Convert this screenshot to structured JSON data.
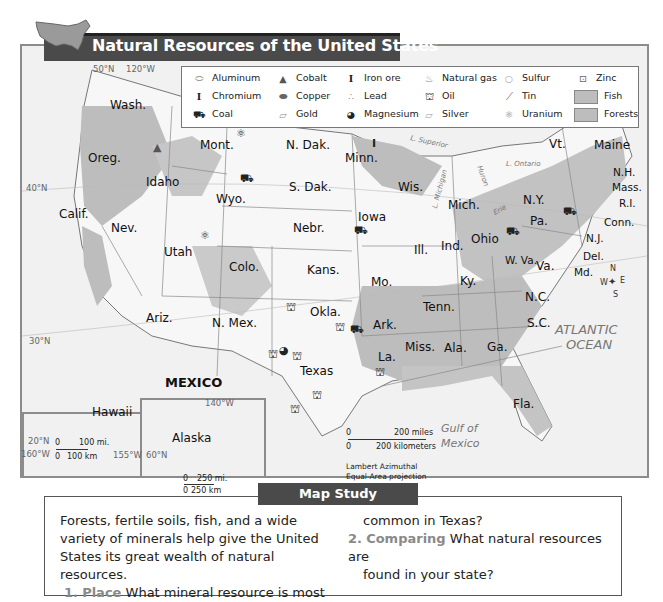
{
  "header": {
    "title": "Natural Resources of the United States"
  },
  "legend": {
    "items": [
      {
        "label": "Aluminum",
        "icon": "cylinder-icon",
        "glyph": "⬭"
      },
      {
        "label": "Chromium",
        "icon": "i-beam-icon",
        "glyph": "I"
      },
      {
        "label": "Coal",
        "icon": "coal-cart-icon",
        "glyph": "⛟"
      },
      {
        "label": "Cobalt",
        "icon": "triangle-icon",
        "glyph": "▲"
      },
      {
        "label": "Copper",
        "icon": "dark-cylinder-icon",
        "glyph": "⬬"
      },
      {
        "label": "Gold",
        "icon": "gold-bar-icon",
        "glyph": "▱"
      },
      {
        "label": "Iron ore",
        "icon": "i-beam-icon",
        "glyph": "I"
      },
      {
        "label": "Lead",
        "icon": "lead-balls-icon",
        "glyph": "∴"
      },
      {
        "label": "Magnesium",
        "icon": "quartered-circle-icon",
        "glyph": "◕"
      },
      {
        "label": "Natural gas",
        "icon": "flame-icon",
        "glyph": "♨"
      },
      {
        "label": "Oil",
        "icon": "oil-derrick-icon",
        "glyph": "⛫"
      },
      {
        "label": "Silver",
        "icon": "silver-bar-icon",
        "glyph": "▱"
      },
      {
        "label": "Sulfur",
        "icon": "circle-icon",
        "glyph": "○"
      },
      {
        "label": "Tin",
        "icon": "tin-sheet-icon",
        "glyph": "⟋"
      },
      {
        "label": "Uranium",
        "icon": "atom-icon",
        "glyph": "⚛"
      },
      {
        "label": "Zinc",
        "icon": "dotted-square-icon",
        "glyph": "⊡"
      },
      {
        "label": "Fish",
        "icon": "fish-swatch",
        "glyph": ""
      },
      {
        "label": "Forests",
        "icon": "forests-swatch",
        "glyph": ""
      }
    ]
  },
  "map": {
    "states": [
      {
        "name": "Wash.",
        "x": 118,
        "y": 97
      },
      {
        "name": "Oreg.",
        "x": 88,
        "y": 155
      },
      {
        "name": "Idaho",
        "x": 145,
        "y": 174
      },
      {
        "name": "Mont.",
        "x": 200,
        "y": 146
      },
      {
        "name": "N. Dak.",
        "x": 286,
        "y": 136
      },
      {
        "name": "S. Dak.",
        "x": 289,
        "y": 178
      },
      {
        "name": "Wyo.",
        "x": 216,
        "y": 190
      },
      {
        "name": "Calif.",
        "x": 58,
        "y": 208
      },
      {
        "name": "Nev.",
        "x": 111,
        "y": 221
      },
      {
        "name": "Utah",
        "x": 164,
        "y": 244
      },
      {
        "name": "Colo.",
        "x": 229,
        "y": 264
      },
      {
        "name": "Nebr.",
        "x": 293,
        "y": 226
      },
      {
        "name": "Kans.",
        "x": 307,
        "y": 271
      },
      {
        "name": "Minn.",
        "x": 345,
        "y": 148
      },
      {
        "name": "Iowa",
        "x": 360,
        "y": 187
      },
      {
        "name": "Wis.",
        "x": 400,
        "y": 178
      },
      {
        "name": "Mich.",
        "x": 448,
        "y": 203
      },
      {
        "name": "Ill.",
        "x": 414,
        "y": 242
      },
      {
        "name": "Ind.",
        "x": 442,
        "y": 241
      },
      {
        "name": "Ohio",
        "x": 470,
        "y": 232
      },
      {
        "name": "Mo.",
        "x": 372,
        "y": 271
      },
      {
        "name": "Ky.",
        "x": 460,
        "y": 273
      },
      {
        "name": "Tenn.",
        "x": 422,
        "y": 292
      },
      {
        "name": "W. Va.",
        "x": 504,
        "y": 250
      },
      {
        "name": "Va.",
        "x": 532,
        "y": 262
      },
      {
        "name": "N.Y.",
        "x": 521,
        "y": 192
      },
      {
        "name": "Pa.",
        "x": 530,
        "y": 216
      },
      {
        "name": "Vt.",
        "x": 550,
        "y": 140
      },
      {
        "name": "Maine",
        "x": 592,
        "y": 141
      },
      {
        "name": "N.H.",
        "x": 612,
        "y": 168
      },
      {
        "name": "Mass.",
        "x": 611,
        "y": 183
      },
      {
        "name": "R.I.",
        "x": 618,
        "y": 198
      },
      {
        "name": "Conn.",
        "x": 604,
        "y": 216
      },
      {
        "name": "N.J.",
        "x": 585,
        "y": 233
      },
      {
        "name": "Del.",
        "x": 590,
        "y": 250
      },
      {
        "name": "Md.",
        "x": 575,
        "y": 266
      },
      {
        "name": "N.C.",
        "x": 524,
        "y": 290
      },
      {
        "name": "S.C.",
        "x": 528,
        "y": 312
      },
      {
        "name": "Ariz.",
        "x": 146,
        "y": 315
      },
      {
        "name": "N. Mex.",
        "x": 212,
        "y": 316
      },
      {
        "name": "Okla.",
        "x": 310,
        "y": 313
      },
      {
        "name": "Ark.",
        "x": 374,
        "y": 319
      },
      {
        "name": "Texas",
        "x": 301,
        "y": 368
      },
      {
        "name": "La.",
        "x": 383,
        "y": 350
      },
      {
        "name": "Miss.",
        "x": 427,
        "y": 340
      },
      {
        "name": "Ala.",
        "x": 462,
        "y": 342
      },
      {
        "name": "Ga.",
        "x": 510,
        "y": 342
      },
      {
        "name": "Fla.",
        "x": 543,
        "y": 404
      },
      {
        "name": "Hawaii",
        "x": 72,
        "y": 393
      },
      {
        "name": "Alaska",
        "x": 148,
        "y": 431
      }
    ],
    "water": [
      {
        "name": "ATLANTIC",
        "x": 556,
        "y": 320,
        "size": 13
      },
      {
        "name": "OCEAN",
        "x": 567,
        "y": 336,
        "size": 13
      },
      {
        "name": "Gulf of",
        "x": 442,
        "y": 421,
        "size": 11
      },
      {
        "name": "Mexico",
        "x": 442,
        "y": 436,
        "size": 11
      },
      {
        "name": "L. Superior",
        "x": 410,
        "y": 138,
        "size": 7
      },
      {
        "name": "L. Ontario",
        "x": 506,
        "y": 158,
        "size": 7
      },
      {
        "name": "L. Michigan",
        "x": 428,
        "y": 178,
        "size": 7
      },
      {
        "name": "Huron",
        "x": 476,
        "y": 172,
        "size": 7
      },
      {
        "name": "Erie",
        "x": 492,
        "y": 209,
        "size": 7
      }
    ],
    "coords": [
      {
        "text": "50°N",
        "x": 93,
        "y": 67
      },
      {
        "text": "120°W",
        "x": 126,
        "y": 67
      },
      {
        "text": "40°N",
        "x": 26,
        "y": 185
      },
      {
        "text": "30°N",
        "x": 29,
        "y": 337
      },
      {
        "text": "140°W",
        "x": 205,
        "y": 400
      },
      {
        "text": "20°N",
        "x": 28,
        "y": 442
      },
      {
        "text": "160°W",
        "x": 22,
        "y": 454
      },
      {
        "text": "155°W",
        "x": 113,
        "y": 454
      },
      {
        "text": "60°N",
        "x": 146,
        "y": 454
      }
    ],
    "country_label": "MEXICO",
    "compass": {
      "n": "N",
      "s": "S",
      "e": "E",
      "w": "W"
    },
    "scale": {
      "miles": "200 miles",
      "km": "200 kilometers",
      "zero": "0",
      "projection_line1": "Lambert Azimuthal",
      "projection_line2": "Equal-Area projection"
    },
    "hawaii_scale": {
      "miles": "100 mi.",
      "km": "100 km",
      "zero": "0"
    },
    "alaska_scale": {
      "miles": "250 mi.",
      "km": "250 km",
      "zero": "0"
    }
  },
  "study": {
    "tab_label": "Map Study",
    "intro": [
      "Forests, fertile soils, fish, and a wide",
      "variety of minerals help give the United",
      "States its great wealth of natural resources."
    ],
    "q1_num": "1.",
    "q1_label": "Place",
    "q1_text": "What mineral resource is most",
    "q1_cont": "common in Texas?",
    "q2_num": "2.",
    "q2_label": "Comparing",
    "q2_text": "What natural resources are",
    "q2_cont": "found in your state?"
  },
  "colors": {
    "banner": "#4a4a4a",
    "forest": "#bdbdbd",
    "land": "#f7f7f7",
    "water": "#ececec",
    "label_accent": "#8a8a8a"
  }
}
